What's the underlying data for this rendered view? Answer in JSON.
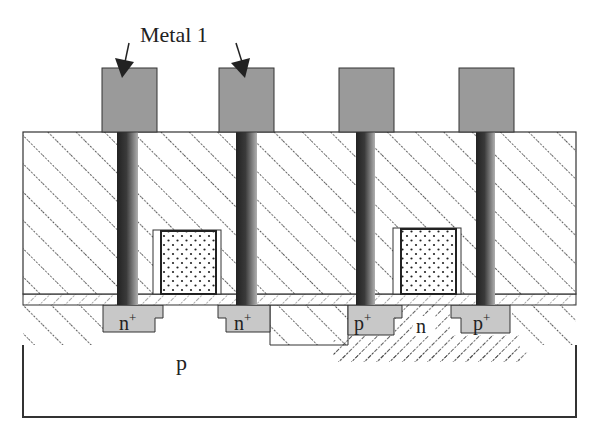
{
  "diagram": {
    "title_annotation": "Metal 1",
    "substrate_label": "p",
    "well_label": "n",
    "contacts": [
      {
        "label": "n",
        "sup": "+"
      },
      {
        "label": "n",
        "sup": "+"
      },
      {
        "label": "p",
        "sup": "+"
      },
      {
        "label": "p",
        "sup": "+"
      }
    ],
    "colors": {
      "metal": "#9a9a9a",
      "diffusion": "#c8c8c8",
      "outline": "#333333",
      "hatch": "#333333",
      "via_dark": "#2a2a2a",
      "via_light": "#aaaaaa"
    }
  }
}
